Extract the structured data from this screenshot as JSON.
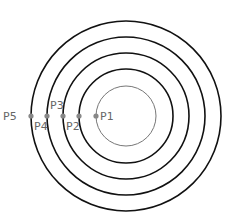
{
  "diagram": {
    "type": "concentric-circles",
    "colors": {
      "inner_circle": "#777777",
      "rings": "#111111",
      "points": "#888888",
      "labels": "#666666"
    },
    "circles": [
      {
        "id": "c1",
        "style": "thin"
      },
      {
        "id": "c2",
        "style": "thick"
      },
      {
        "id": "c3",
        "style": "thick"
      },
      {
        "id": "c4",
        "style": "thick"
      },
      {
        "id": "c5",
        "style": "thick"
      }
    ],
    "points": [
      {
        "label": "P1",
        "on_circle": "c1"
      },
      {
        "label": "P2",
        "on_circle": "c2"
      },
      {
        "label": "P3",
        "on_circle": "c3"
      },
      {
        "label": "P4",
        "on_circle": "c4"
      },
      {
        "label": "P5",
        "on_circle": "c5"
      }
    ]
  }
}
